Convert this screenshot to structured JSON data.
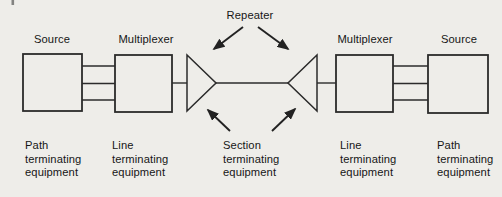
{
  "colors": {
    "background": "#eeede9",
    "line": "#2b2b2b",
    "text": "#161616"
  },
  "diagram": {
    "repeater_label": "Repeater",
    "top_labels": {
      "source_left": "Source",
      "multiplexer_left": "Multiplexer",
      "multiplexer_right": "Multiplexer",
      "source_right": "Source"
    },
    "bottom_labels": {
      "path_left": [
        "Path",
        "terminating",
        "equipment"
      ],
      "line_left": [
        "Line",
        "terminating",
        "equipment"
      ],
      "section_center": [
        "Section",
        "terminating",
        "equipment"
      ],
      "line_right": [
        "Line",
        "terminating",
        "equipment"
      ],
      "path_right": [
        "Path",
        "terminating",
        "equipment"
      ]
    },
    "icons": [
      "repeater-amplifier-triangle-left",
      "repeater-amplifier-triangle-right",
      "arrow-down-left-icon",
      "arrow-down-right-icon",
      "arrow-up-left-icon",
      "arrow-up-right-icon"
    ]
  }
}
